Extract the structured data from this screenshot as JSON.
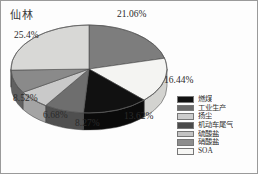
{
  "panel": {
    "title": "仙林",
    "border_color": "#9a9a9a",
    "background": "#fdfdfd"
  },
  "chart_data": {
    "type": "pie",
    "title": "仙林",
    "xlabel": "",
    "ylabel": "",
    "three_d": true,
    "legend_position": "bottom-right",
    "grid": false,
    "categories": [
      "燃煤",
      "工业生产",
      "扬尘",
      "机动车尾气",
      "硫酸盐",
      "硝酸盐",
      "SOA"
    ],
    "values": [
      21.06,
      16.44,
      13.62,
      8.27,
      6.68,
      8.52,
      25.4
    ],
    "labels": [
      "21.06%",
      "16.44%",
      "13.62%",
      "8.27%",
      "6.68%",
      "8.52%",
      "25.4%"
    ],
    "colors": [
      "#7d7d7d",
      "#f4f4f2",
      "#111111",
      "#6e6e6e",
      "#c9c9c9",
      "#8a8a8a",
      "#d8d8d6"
    ],
    "slices": [
      {
        "name": "燃煤",
        "value": 21.06,
        "label": "21.06%",
        "color": "#7d7d7d",
        "side_color": "#5c5c5c"
      },
      {
        "name": "SOA",
        "value": 16.44,
        "label": "16.44%",
        "color": "#f4f4f2",
        "side_color": "#d3d3d0"
      },
      {
        "name": "工业生产",
        "value": 13.62,
        "label": "13.62%",
        "color": "#111111",
        "side_color": "#0a0a0a"
      },
      {
        "name": "机动车尾气",
        "value": 8.27,
        "label": "8.27%",
        "color": "#6e6e6e",
        "side_color": "#4f4f4f"
      },
      {
        "name": "硫酸盐",
        "value": 6.68,
        "label": "6.68%",
        "color": "#c9c9c9",
        "side_color": "#a4a4a4"
      },
      {
        "name": "硝酸盐",
        "value": 8.52,
        "label": "8.52%",
        "color": "#8a8a8a",
        "side_color": "#616161"
      },
      {
        "name": "扬尘",
        "value": 25.4,
        "label": "25.4%",
        "color": "#d8d8d6",
        "side_color": "#b0b0ae"
      }
    ]
  },
  "pct_labels": [
    {
      "text": "21.06%",
      "x": 116,
      "y": 8
    },
    {
      "text": "25.4%",
      "x": 13,
      "y": 29
    },
    {
      "text": "16.44%",
      "x": 163,
      "y": 74
    },
    {
      "text": "8.52%",
      "x": 12,
      "y": 92
    },
    {
      "text": "13.62%",
      "x": 123,
      "y": 110
    },
    {
      "text": "6.68%",
      "x": 42,
      "y": 109
    },
    {
      "text": "8.27%",
      "x": 74,
      "y": 117
    }
  ],
  "legend": {
    "items": [
      {
        "label": "燃煤",
        "color": "#111111"
      },
      {
        "label": "工业生产",
        "color": "#6b6b6b"
      },
      {
        "label": "扬尘",
        "color": "#cccccc"
      },
      {
        "label": "机动车尾气",
        "color": "#4a4a4a"
      },
      {
        "label": "硫酸盐",
        "color": "#c4c4c4"
      },
      {
        "label": "硝酸盐",
        "color": "#8d8d8d"
      },
      {
        "label": "SOA",
        "color": "#f6f6f4"
      }
    ]
  }
}
